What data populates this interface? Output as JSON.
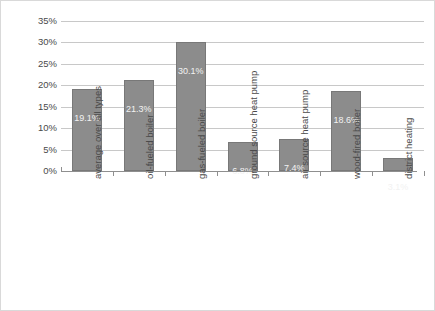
{
  "chart_data": {
    "type": "bar",
    "title": "",
    "xlabel": "",
    "ylabel": "Percentage of heating system [%]",
    "categories": [
      "average over all types",
      "oil-fueled boiler",
      "gas-fueled boiler",
      "ground source heat pump",
      "air source heat pump",
      "wood-fired boiler",
      "district heating"
    ],
    "values": [
      19.1,
      21.3,
      30.1,
      6.8,
      7.4,
      18.6,
      3.1
    ],
    "value_labels": [
      "19.1%",
      "21.3%",
      "30.1%",
      "6.8%",
      "7.4%",
      "18.6%",
      "3.1%"
    ],
    "ylim": [
      0,
      35
    ],
    "ytick_values": [
      0,
      5,
      10,
      15,
      20,
      25,
      30,
      35
    ],
    "ytick_labels": [
      "0%",
      "5%",
      "10%",
      "15%",
      "20%",
      "25%",
      "30%",
      "35%"
    ],
    "grid": "horizontal",
    "legend": "none",
    "bar_color": "#8c8c8c",
    "bar_edge_color": "#787878",
    "gridline_color": "#c8c8c8",
    "axis_color": "#8f8f8f",
    "text_color": "#4a4a4a",
    "label_text_color": "#f2f2f2",
    "background_color": "#ffffff"
  }
}
